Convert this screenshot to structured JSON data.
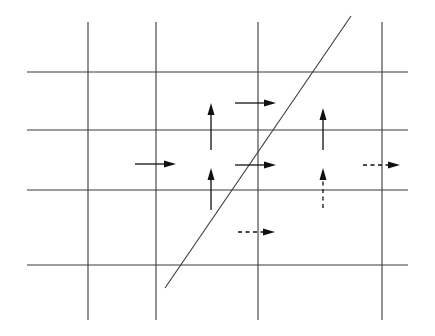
{
  "diagram": {
    "type": "staggered-grid-with-interface",
    "colors": {
      "background": "#ffffff",
      "grid": "#3a3a3a",
      "arrow": "#111111"
    },
    "grid": {
      "horizontal_lines": [
        {
          "y": 72,
          "x1": 27,
          "x2": 408
        },
        {
          "y": 130,
          "x1": 27,
          "x2": 408
        },
        {
          "y": 190,
          "x1": 27,
          "x2": 408
        },
        {
          "y": 265,
          "x1": 27,
          "x2": 408
        }
      ],
      "vertical_lines": [
        {
          "x": 88,
          "y1": 22,
          "y2": 320
        },
        {
          "x": 156,
          "y1": 22,
          "y2": 320
        },
        {
          "x": 258,
          "y1": 22,
          "y2": 320
        },
        {
          "x": 382,
          "y1": 22,
          "y2": 320
        }
      ]
    },
    "interface_line": {
      "x1": 351,
      "y1": 16,
      "x2": 165,
      "y2": 288
    },
    "arrows": [
      {
        "id": "u-solid-1",
        "direction": "right",
        "style": "solid",
        "x1": 135,
        "y1": 164,
        "x2": 176,
        "y2": 164
      },
      {
        "id": "u-solid-2",
        "direction": "right",
        "style": "solid",
        "x1": 235,
        "y1": 103,
        "x2": 276,
        "y2": 103
      },
      {
        "id": "u-solid-3",
        "direction": "right",
        "style": "solid",
        "x1": 235,
        "y1": 165,
        "x2": 276,
        "y2": 165
      },
      {
        "id": "u-dashed-1",
        "direction": "right",
        "style": "dashed",
        "x1": 363,
        "y1": 165,
        "x2": 400,
        "y2": 165
      },
      {
        "id": "u-dashed-2",
        "direction": "right",
        "style": "dashed",
        "x1": 238,
        "y1": 232,
        "x2": 275,
        "y2": 232
      },
      {
        "id": "v-solid-1",
        "direction": "up",
        "style": "solid",
        "x1": 211,
        "y1": 150,
        "x2": 211,
        "y2": 103
      },
      {
        "id": "v-solid-2",
        "direction": "up",
        "style": "solid",
        "x1": 211,
        "y1": 210,
        "x2": 211,
        "y2": 168
      },
      {
        "id": "v-solid-3",
        "direction": "up",
        "style": "solid",
        "x1": 323,
        "y1": 150,
        "x2": 323,
        "y2": 108
      },
      {
        "id": "v-dashed-1",
        "direction": "up",
        "style": "dashed",
        "x1": 323,
        "y1": 208,
        "x2": 323,
        "y2": 168
      }
    ]
  }
}
